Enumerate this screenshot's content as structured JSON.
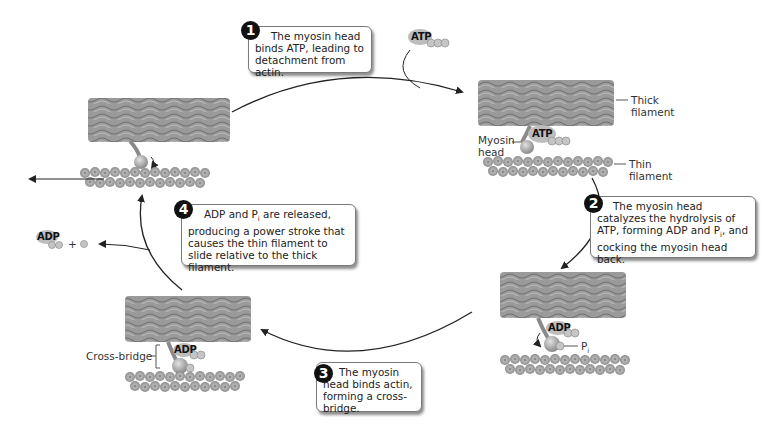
{
  "steps": [
    {
      "number": "1",
      "text": "The myosin head binds ATP, leading to detachment from actin."
    },
    {
      "number": "2",
      "text_a": "The myosin head catalyzes the hydrolysis of ATP, forming ADP and P",
      "sub": "i",
      "text_b": ", and cocking the myosin head back."
    },
    {
      "number": "3",
      "text": "The myosin head binds actin, forming a cross-bridge."
    },
    {
      "number": "4",
      "text_a": "ADP and P",
      "sub": "i",
      "text_b": " are released, producing a power stroke that causes the thin filament to slide relative to the thick filament."
    }
  ],
  "labels": {
    "thick_filament": "Thick filament",
    "thin_filament": "Thin filament",
    "myosin_head": "Myosin head",
    "cross_bridge": "Cross-bridge",
    "pi": "P",
    "pi_sub": "i",
    "plus": "+"
  },
  "molecules": {
    "atp": "ATP",
    "adp": "ADP"
  },
  "colors": {
    "filament": "#8e8e8e",
    "bead": "#a8a8a8",
    "callout_border": "#7a7a7a",
    "arrow": "#222222"
  }
}
